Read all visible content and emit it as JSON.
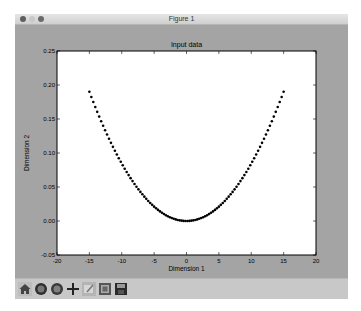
{
  "window": {
    "title": "Figure 1",
    "traffic_lights": [
      "close",
      "minimize",
      "zoom"
    ]
  },
  "toolbar": {
    "buttons": [
      {
        "name": "home",
        "icon": "home-icon"
      },
      {
        "name": "back",
        "icon": "back-arrow-icon"
      },
      {
        "name": "forward",
        "icon": "forward-arrow-icon"
      },
      {
        "name": "pan",
        "icon": "move-cross-icon"
      },
      {
        "name": "zoom",
        "icon": "zoom-rect-icon"
      },
      {
        "name": "subplots",
        "icon": "subplots-config-icon"
      },
      {
        "name": "save",
        "icon": "save-floppy-icon"
      }
    ]
  },
  "chart_data": {
    "type": "scatter",
    "title": "Input data",
    "xlabel": "Dimension 1",
    "ylabel": "Dimension 2",
    "xlim": [
      -20,
      20
    ],
    "ylim": [
      -0.05,
      0.25
    ],
    "xticks": [
      "-20",
      "-15",
      "-10",
      "-5",
      "0",
      "5",
      "10",
      "15",
      "20"
    ],
    "yticks": [
      "-0.05",
      "0.00",
      "0.05",
      "0.10",
      "0.15",
      "0.20",
      "0.25"
    ],
    "grid": false,
    "marker_color": "#000000",
    "series": [
      {
        "name": "data",
        "description": "parabola y ≈ x²/1184, x from -15 to 15",
        "x_range": [
          -15,
          15
        ],
        "num_points": 100,
        "x": [
          -15,
          -12,
          -9,
          -6,
          -3,
          0,
          3,
          6,
          9,
          12,
          15
        ],
        "y": [
          0.19,
          0.122,
          0.068,
          0.03,
          0.008,
          0.0,
          0.008,
          0.03,
          0.068,
          0.122,
          0.19
        ]
      }
    ]
  }
}
